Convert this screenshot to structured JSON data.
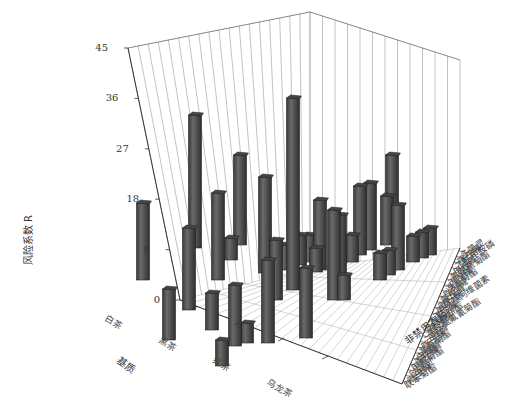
{
  "chart_data": {
    "type": "bar3d",
    "title": "",
    "zlabel": "风险系数 R",
    "xlabel": "基质",
    "ylabel": "非禁用农药",
    "z_ticks": [
      0,
      9,
      18,
      27,
      36,
      45
    ],
    "zlim": [
      0,
      45
    ],
    "x_categories": [
      "白茶",
      "黑茶",
      "红茶",
      "乌龙茶"
    ],
    "y_categories": [
      "联苯菊酯",
      "吡虫啉",
      "哒螨灵",
      "甲氰菊酯",
      "毒死蜱",
      "虫螨腈",
      "氯氰菊酯",
      "啶虫脒",
      "三唑磷",
      "高效氯氟氰菊酯",
      "噻嗪酮",
      "联苯肼酯",
      "灭多威",
      "甲氨基阿维菌素",
      "吡蚜酮",
      "氟虫腈",
      "异丙威",
      "溴氰菊酯",
      "丙溴磷",
      "氟氯氰菊酯",
      "甲胺磷",
      "乙酰甲胺磷",
      "噻虫嗪",
      "多菌灵"
    ],
    "bars_screen": [
      {
        "x": 143,
        "top": 203,
        "bottom": 280
      },
      {
        "x": 169,
        "top": 289,
        "bottom": 340
      },
      {
        "x": 195,
        "top": 115,
        "bottom": 248
      },
      {
        "x": 189,
        "top": 228,
        "bottom": 310
      },
      {
        "x": 212,
        "top": 293,
        "bottom": 330
      },
      {
        "x": 222,
        "top": 340,
        "bottom": 366
      },
      {
        "x": 218,
        "top": 193,
        "bottom": 280
      },
      {
        "x": 240,
        "top": 155,
        "bottom": 245
      },
      {
        "x": 235,
        "top": 285,
        "bottom": 346
      },
      {
        "x": 247,
        "top": 323,
        "bottom": 343
      },
      {
        "x": 231,
        "top": 238,
        "bottom": 260
      },
      {
        "x": 268,
        "top": 260,
        "bottom": 343
      },
      {
        "x": 265,
        "top": 177,
        "bottom": 273
      },
      {
        "x": 276,
        "top": 240,
        "bottom": 300
      },
      {
        "x": 293,
        "top": 98,
        "bottom": 290
      },
      {
        "x": 300,
        "top": 235,
        "bottom": 265
      },
      {
        "x": 285,
        "top": 245,
        "bottom": 270
      },
      {
        "x": 306,
        "top": 268,
        "bottom": 338
      },
      {
        "x": 320,
        "top": 200,
        "bottom": 270
      },
      {
        "x": 334,
        "top": 210,
        "bottom": 300
      },
      {
        "x": 340,
        "top": 215,
        "bottom": 290
      },
      {
        "x": 360,
        "top": 186,
        "bottom": 255
      },
      {
        "x": 370,
        "top": 183,
        "bottom": 250
      },
      {
        "x": 352,
        "top": 235,
        "bottom": 262
      },
      {
        "x": 344,
        "top": 275,
        "bottom": 300
      },
      {
        "x": 387,
        "top": 196,
        "bottom": 245
      },
      {
        "x": 392,
        "top": 155,
        "bottom": 230
      },
      {
        "x": 398,
        "top": 205,
        "bottom": 270
      },
      {
        "x": 380,
        "top": 253,
        "bottom": 280
      },
      {
        "x": 389,
        "top": 250,
        "bottom": 275
      },
      {
        "x": 413,
        "top": 236,
        "bottom": 262
      },
      {
        "x": 422,
        "top": 232,
        "bottom": 258
      },
      {
        "x": 430,
        "top": 228,
        "bottom": 255
      },
      {
        "x": 309,
        "top": 235,
        "bottom": 262
      },
      {
        "x": 316,
        "top": 248,
        "bottom": 272
      }
    ]
  }
}
